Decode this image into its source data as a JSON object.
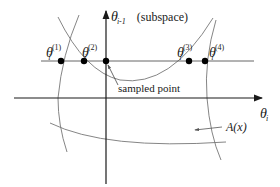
{
  "figure": {
    "vertical_axis": {
      "symbol": "θ",
      "subscript": "i-1",
      "annotation": "(subspace)"
    },
    "horizontal_axis": {
      "symbol": "θ",
      "subscript": "i"
    },
    "points": [
      {
        "symbol": "θ",
        "subscript": "i",
        "superscript": "(1)"
      },
      {
        "symbol": "θ",
        "subscript": "i",
        "superscript": "(2)"
      },
      {
        "symbol": "θ",
        "subscript": "i",
        "superscript": "(3)"
      },
      {
        "symbol": "θ",
        "subscript": "i",
        "superscript": "(4)"
      }
    ],
    "sampled_point_label": "sampled point",
    "region_label": "A(x)",
    "colors": {
      "axis": "#1a1a1a",
      "curve": "#6e6e6e",
      "point": "#000000"
    }
  }
}
